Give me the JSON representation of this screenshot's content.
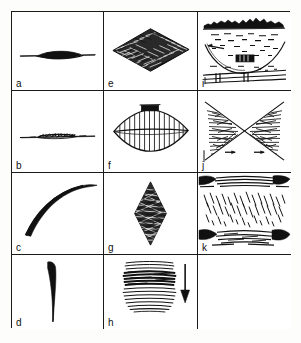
{
  "figure": {
    "background_color": "#ffffff",
    "ink_color": "#111111",
    "frame_color": "#1a1a1a",
    "columns": 3,
    "rows": 4,
    "panel_count": 11,
    "empty_cells": 1
  },
  "panels": [
    {
      "id": "a",
      "label": "a",
      "row": 1,
      "column": 1,
      "icon": "lens-line-sketch",
      "description": "Thin horizontal line with a solid black lens-shaped thickening at its centre"
    },
    {
      "id": "b",
      "label": "b",
      "row": 2,
      "column": 1,
      "icon": "ragged-line-sketch",
      "description": "Thin horizontal line with a ragged, irregular scribbled thickening in the middle"
    },
    {
      "id": "c",
      "label": "c",
      "row": 3,
      "column": 1,
      "icon": "convex-arc-sketch",
      "description": "Thick tapering arc rising steeply from lower left and flattening toward the upper right"
    },
    {
      "id": "d",
      "label": "d",
      "row": 4,
      "column": 1,
      "icon": "vertical-taper-curve-sketch",
      "description": "Thick-at-top vertical curve tapering to a hairline at the bottom"
    },
    {
      "id": "e",
      "label": "e",
      "row": 1,
      "column": 2,
      "icon": "flat-diamond-fill-sketch",
      "description": "Wide flattened rhombus densely filled with short scribbled strokes"
    },
    {
      "id": "f",
      "label": "f",
      "row": 2,
      "column": 2,
      "icon": "lens-hatched-sketch",
      "description": "Lens/leaf outline with vertical hatch lines, a horizontal axis line and a solid dark cap on top"
    },
    {
      "id": "g",
      "label": "g",
      "row": 3,
      "column": 2,
      "icon": "tall-diamond-fill-sketch",
      "description": "Tall upright diamond densely filled with scribbled strokes"
    },
    {
      "id": "h",
      "label": "h",
      "row": 4,
      "column": 2,
      "icon": "banded-scribble-with-arrow-sketch",
      "description": "Horizontal scribbled band, darkest in its middle, with a downward arrow at its right",
      "arrow": "down-arrow"
    },
    {
      "id": "i",
      "label": "i",
      "row": 1,
      "column": 3,
      "icon": "landscape-basin-sketch",
      "description": "Landscape sketch: dark ragged skyline ridge, a broad curved basin arc, a small dark block at centre and bundled linear strokes below"
    },
    {
      "id": "j",
      "label": "j",
      "row": 2,
      "column": 3,
      "icon": "bowtie-scribble-sketch",
      "description": "Bowtie / hourglass X figure with the left and right triangles filled with scribbles and small horizontal arrows"
    },
    {
      "id": "k",
      "label": "k",
      "row": 3,
      "column": 3,
      "icon": "banded-hatch-layers-sketch",
      "description": "Dark heavy bands at top and bottom with a zone of diagonal hatch strokes between them"
    }
  ]
}
